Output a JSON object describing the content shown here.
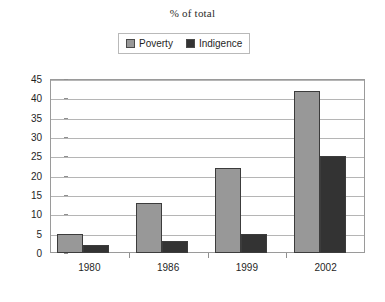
{
  "chart_data": {
    "type": "bar",
    "title": "% of total",
    "xlabel": "",
    "ylabel": "",
    "categories": [
      "1980",
      "1986",
      "1999",
      "2002"
    ],
    "series": [
      {
        "name": "Poverty",
        "color": "#989898",
        "values": [
          5,
          13,
          22,
          42
        ]
      },
      {
        "name": "Indigence",
        "color": "#333333",
        "values": [
          2,
          3,
          5,
          25
        ]
      }
    ],
    "ylim": [
      0,
      45
    ],
    "ytick_step": 5,
    "ytick_labels": [
      "45",
      "40",
      "35",
      "30",
      "25",
      "20",
      "15",
      "10",
      "5",
      "0"
    ],
    "grid": true,
    "legend_position": "top-center"
  },
  "legend": {
    "entries": [
      {
        "label": "Poverty",
        "swatch": "legend-swatch-gray"
      },
      {
        "label": "Indigence",
        "swatch": "legend-swatch-dark"
      }
    ]
  },
  "colors": {
    "poverty": "#989898",
    "indigence": "#333333",
    "gridline": "#b5b5b5",
    "frame": "#9a9a9a",
    "text": "#1f1f1f"
  }
}
